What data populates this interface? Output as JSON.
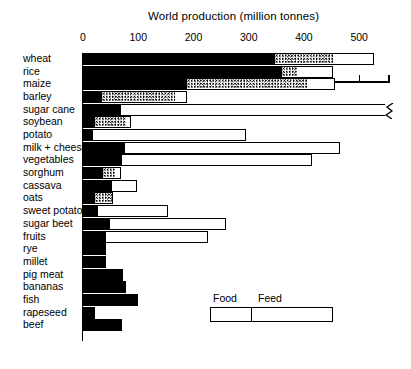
{
  "chart_data": {
    "type": "bar",
    "orientation": "horizontal",
    "stacked": true,
    "title": "World production (million tonnes)",
    "xlabel": "World production (million tonnes)",
    "ylabel": "",
    "xlim": [
      0,
      555
    ],
    "xticks": [
      0,
      100,
      200,
      300,
      400,
      500
    ],
    "xtick_labels": [
      "0",
      "100",
      "200",
      "300",
      "400",
      "500"
    ],
    "xminorticks": [
      50,
      150,
      250,
      350,
      450
    ],
    "grid": false,
    "legend_position": "inside-bottom-right",
    "legend": [
      "Food",
      "Feed"
    ],
    "series": [
      {
        "name": "Food",
        "color": "#000000",
        "fill": "solid"
      },
      {
        "name": "Feed",
        "color": "#ffffff",
        "fill": "stippled"
      },
      {
        "name": "Other",
        "color": "#ffffff",
        "fill": "empty"
      }
    ],
    "categories": [
      "wheat",
      "rice",
      "maize",
      "barley",
      "sugar cane",
      "soybean",
      "potato",
      "milk + cheese",
      "vegetables",
      "sorghum",
      "cassava",
      "oats",
      "sweet potato",
      "sugar beet",
      "fruits",
      "rye",
      "millet",
      "pig meat",
      "bananas",
      "fish",
      "rapeseed",
      "beef"
    ],
    "values": {
      "food": [
        348,
        360,
        188,
        34,
        69,
        22,
        18,
        76,
        70,
        36,
        52,
        22,
        28,
        49,
        42,
        42,
        42,
        73,
        78,
        100,
        22,
        70
      ],
      "feed": [
        105,
        27,
        220,
        132,
        0,
        55,
        0,
        0,
        0,
        22,
        0,
        33,
        0,
        0,
        0,
        0,
        0,
        0,
        0,
        0,
        0,
        0
      ],
      "other": [
        74,
        66,
        48,
        22,
        690,
        10,
        277,
        390,
        345,
        10,
        45,
        0,
        125,
        210,
        185,
        0,
        0,
        0,
        0,
        0,
        0,
        0
      ]
    },
    "totals": [
      527,
      453,
      456,
      188,
      759,
      87,
      295,
      466,
      415,
      68,
      97,
      55,
      153,
      259,
      227,
      42,
      42,
      73,
      78,
      100,
      22,
      70
    ],
    "axis_break": {
      "category": "sugar cane",
      "symbol": "break-zigzag",
      "note": "bar extends beyond axis"
    }
  },
  "chart": {
    "title": "World production (million tonnes)",
    "legend": {
      "food_label": "Food",
      "feed_label": "Feed"
    }
  }
}
